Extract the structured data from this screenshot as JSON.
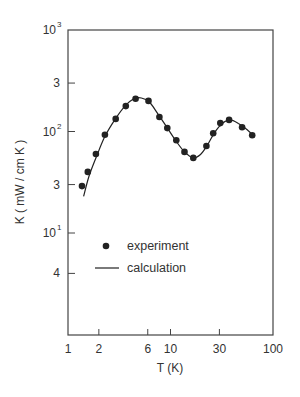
{
  "chart_data": {
    "type": "scatter",
    "title": "",
    "xlabel": "T (K)",
    "ylabel": "K ( mW / cm K )",
    "xscale": "log",
    "yscale": "log",
    "xlim": [
      1,
      100
    ],
    "ylim": [
      2,
      1000
    ],
    "grid": false,
    "legend_position": "inside-lower-left",
    "x_ticks": [
      {
        "value": 1,
        "label": "1"
      },
      {
        "value": 2,
        "label": "2"
      },
      {
        "value": 6,
        "label": "6"
      },
      {
        "value": 10,
        "label": "10"
      },
      {
        "value": 30,
        "label": "30"
      },
      {
        "value": 100,
        "label": "100"
      }
    ],
    "y_ticks": [
      {
        "value": 1000,
        "label": "10",
        "sup": "3"
      },
      {
        "value": 300,
        "label": "3",
        "sup": ""
      },
      {
        "value": 100,
        "label": "10",
        "sup": "2"
      },
      {
        "value": 30,
        "label": "3",
        "sup": ""
      },
      {
        "value": 10,
        "label": "10",
        "sup": "1"
      },
      {
        "value": 4,
        "label": "4",
        "sup": ""
      }
    ],
    "series": [
      {
        "name": "experiment",
        "style": "markers",
        "x": [
          1.37,
          1.56,
          1.87,
          2.29,
          2.92,
          3.66,
          4.57,
          6.1,
          7.8,
          9.3,
          11.4,
          13.7,
          16.7,
          22.4,
          26.1,
          30.6,
          37.3,
          49.9,
          62.7
        ],
        "y": [
          29,
          40,
          60,
          93,
          133,
          178,
          210,
          200,
          139,
          108,
          82,
          63,
          55,
          72,
          96,
          121,
          130,
          110,
          92
        ]
      },
      {
        "name": "calculation",
        "style": "line",
        "x": [
          1.42,
          1.6,
          1.9,
          2.3,
          2.9,
          3.6,
          4.4,
          5.2,
          6.2,
          7.5,
          9.0,
          11.0,
          13.5,
          16.5,
          19.5,
          23.0,
          27.0,
          32.0,
          38.0,
          46.0,
          56.0,
          66.0
        ],
        "y": [
          23,
          36,
          57,
          90,
          133,
          178,
          210,
          214,
          196,
          150,
          114,
          84,
          64,
          55,
          59,
          74,
          98,
          120,
          130,
          120,
          104,
          88
        ]
      }
    ]
  },
  "legend": {
    "items": [
      {
        "label": "experiment",
        "symbol": "dot"
      },
      {
        "label": "calculation",
        "symbol": "line"
      }
    ]
  },
  "axes": {
    "xlabel": "T (K)",
    "ylabel": "K ( mW / cm K )"
  },
  "colors": {
    "ink": "#222222",
    "axis": "#444444",
    "background": "#ffffff"
  }
}
